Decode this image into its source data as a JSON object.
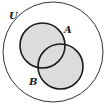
{
  "diagram": {
    "type": "venn",
    "universe": {
      "label": "U",
      "cx": 53,
      "cy": 52,
      "r": 50
    },
    "sets": [
      {
        "label": "A",
        "cx": 42.5,
        "cy": 45.5,
        "r": 22.5,
        "label_x": 66,
        "label_y": 33
      },
      {
        "label": "B",
        "cx": 60.5,
        "cy": 66.5,
        "r": 22.5,
        "label_x": 30,
        "label_y": 85
      }
    ],
    "universe_label_pos": {
      "x": 11,
      "y": 18
    },
    "shaded_region": "A ∪ B",
    "colors": {
      "shade": "#dcdcdc",
      "stroke": "#1a1a1a",
      "outer_stroke": "#333333",
      "background": "#ffffff"
    }
  }
}
